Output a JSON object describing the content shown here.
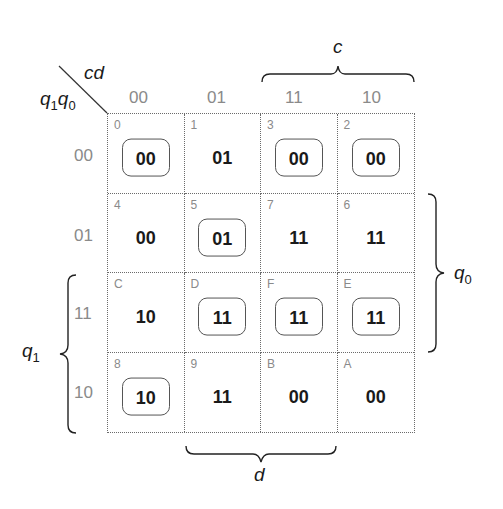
{
  "map": {
    "corner_col_var": "cd",
    "corner_row_var_1": "q",
    "corner_row_sub_1": "1",
    "corner_row_var_2": "q",
    "corner_row_sub_2": "0",
    "col_headers": [
      "00",
      "01",
      "11",
      "10"
    ],
    "row_headers": [
      "00",
      "01",
      "11",
      "10"
    ],
    "cells": [
      [
        {
          "index": "0",
          "value": "00",
          "circled": true
        },
        {
          "index": "1",
          "value": "01",
          "circled": false
        },
        {
          "index": "3",
          "value": "00",
          "circled": true
        },
        {
          "index": "2",
          "value": "00",
          "circled": true
        }
      ],
      [
        {
          "index": "4",
          "value": "00",
          "circled": false
        },
        {
          "index": "5",
          "value": "01",
          "circled": true
        },
        {
          "index": "7",
          "value": "11",
          "circled": false
        },
        {
          "index": "6",
          "value": "11",
          "circled": false
        }
      ],
      [
        {
          "index": "C",
          "value": "10",
          "circled": false
        },
        {
          "index": "D",
          "value": "11",
          "circled": true
        },
        {
          "index": "F",
          "value": "11",
          "circled": true
        },
        {
          "index": "E",
          "value": "11",
          "circled": true
        }
      ],
      [
        {
          "index": "8",
          "value": "10",
          "circled": true
        },
        {
          "index": "9",
          "value": "11",
          "circled": false
        },
        {
          "index": "B",
          "value": "00",
          "circled": false
        },
        {
          "index": "A",
          "value": "00",
          "circled": false
        }
      ]
    ],
    "braces": {
      "c": {
        "label": "c",
        "position": "top",
        "spans_cols": [
          "11",
          "10"
        ]
      },
      "d": {
        "label": "d",
        "position": "bottom",
        "spans_cols": [
          "01",
          "11"
        ]
      },
      "q0": {
        "label": "q",
        "sub": "0",
        "position": "right",
        "spans_rows": [
          "01",
          "11"
        ]
      },
      "q1": {
        "label": "q",
        "sub": "1",
        "position": "left",
        "spans_rows": [
          "11",
          "10"
        ]
      }
    }
  }
}
